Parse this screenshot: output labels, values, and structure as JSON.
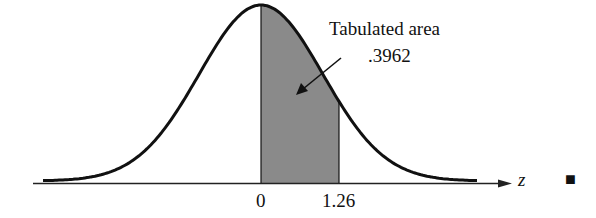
{
  "diagram": {
    "annotation": {
      "line1": "Tabulated area",
      "line2": ".3962"
    },
    "axis": {
      "variable": "z",
      "ticks": [
        "0",
        "1.26"
      ]
    },
    "end_marker": "■",
    "colors": {
      "curve": "#111111",
      "shade": "#8a8a8a",
      "axis": "#222222"
    }
  },
  "chart_data": {
    "type": "area",
    "xlabel": "z",
    "ylabel": "",
    "shaded_interval": [
      0,
      1.26
    ],
    "shaded_area": 0.3962,
    "x_ticks": [
      "0",
      "1.26"
    ],
    "annotation": "Tabulated area .3962",
    "grid": false
  }
}
